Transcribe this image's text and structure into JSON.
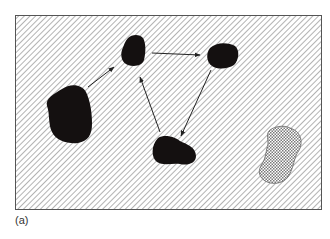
{
  "figure": {
    "caption": "(a)",
    "frame": {
      "x": 15,
      "y": 15,
      "width": 307,
      "height": 195,
      "fill_pattern": "diagonal-hatch",
      "stroke": "#555555"
    },
    "colors": {
      "hatch": "#8a8a8a",
      "blob": "#141010",
      "arrow": "#222222",
      "crosshatch": "#777777",
      "background": "#ffffff"
    },
    "nodes": [
      {
        "id": "large-blob-left",
        "fill": "solid-black"
      },
      {
        "id": "top-middle-blob",
        "fill": "solid-black"
      },
      {
        "id": "top-right-blob",
        "fill": "solid-black"
      },
      {
        "id": "bottom-middle-blob",
        "fill": "solid-black"
      },
      {
        "id": "crosshatched-blob-right",
        "fill": "crosshatch"
      }
    ],
    "edges": [
      {
        "from": "large-blob-left",
        "to": "top-middle-blob"
      },
      {
        "from": "top-middle-blob",
        "to": "top-right-blob"
      },
      {
        "from": "top-right-blob",
        "to": "bottom-middle-blob"
      },
      {
        "from": "bottom-middle-blob",
        "to": "top-middle-blob"
      }
    ]
  }
}
